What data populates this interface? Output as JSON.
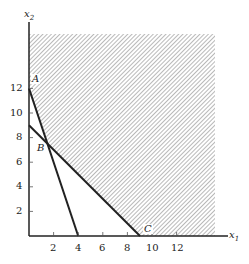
{
  "figure": {
    "type": "linear-programming-feasible-region",
    "x_axis": {
      "label": "x",
      "subscript": "1",
      "ticks": [
        "2",
        "4",
        "6",
        "8",
        "10",
        "12"
      ]
    },
    "y_axis": {
      "label": "x",
      "subscript": "2",
      "ticks": [
        "2",
        "4",
        "6",
        "8",
        "10",
        "12"
      ]
    },
    "points": [
      {
        "name": "A",
        "x": 0,
        "y": 12
      },
      {
        "name": "B",
        "x": 1.5,
        "y": 7.5
      },
      {
        "name": "C",
        "x": 9,
        "y": 0
      }
    ],
    "lines": [
      {
        "from": [
          0,
          12
        ],
        "to": [
          4,
          0
        ]
      },
      {
        "from": [
          0,
          9
        ],
        "to": [
          9,
          0
        ]
      }
    ],
    "shading": "diagonal hatch above both constraint lines",
    "colors": {
      "line": "#222222",
      "hatch": "#8a8a8a",
      "background": "#ffffff"
    }
  }
}
